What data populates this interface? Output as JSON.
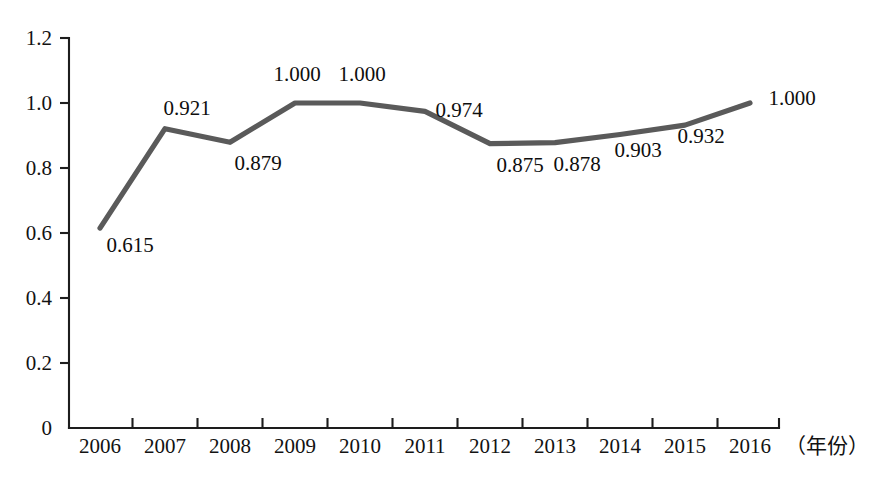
{
  "chart_data": {
    "type": "line",
    "title": "",
    "subtitle": "",
    "xlabel": "（年份）",
    "ylabel": "",
    "categories": [
      "2006",
      "2007",
      "2008",
      "2009",
      "2010",
      "2011",
      "2012",
      "2013",
      "2014",
      "2015",
      "2016"
    ],
    "values": [
      0.615,
      0.921,
      0.879,
      1.0,
      1.0,
      0.974,
      0.875,
      0.878,
      0.903,
      0.932,
      1.0
    ],
    "point_labels": [
      "0.615",
      "0.921",
      "0.879",
      "1.000",
      "1.000",
      "0.974",
      "0.875",
      "0.878",
      "0.903",
      "0.932",
      "1.000"
    ],
    "ylim": [
      0,
      1.2
    ],
    "ytick_values": [
      0,
      0.2,
      0.4,
      0.6,
      0.8,
      1.0,
      1.2
    ],
    "ytick_labels": [
      "0",
      "0.2",
      "0.4",
      "0.6",
      "0.8",
      "1.0",
      "1.2"
    ],
    "grid": false,
    "legend": "none",
    "series_color": "#5a5a5a",
    "axis_color": "#1d1d1d",
    "background_color": "#ffffff"
  },
  "label_offsets": [
    {
      "dx": 30,
      "dy": 24
    },
    {
      "dx": 22,
      "dy": -14
    },
    {
      "dx": 28,
      "dy": 28
    },
    {
      "dx": 2,
      "dy": -22
    },
    {
      "dx": 2,
      "dy": -22
    },
    {
      "dx": 34,
      "dy": 6
    },
    {
      "dx": 30,
      "dy": 28
    },
    {
      "dx": 22,
      "dy": 28
    },
    {
      "dx": 18,
      "dy": 22
    },
    {
      "dx": 16,
      "dy": 18
    },
    {
      "dx": 42,
      "dy": 2
    }
  ]
}
